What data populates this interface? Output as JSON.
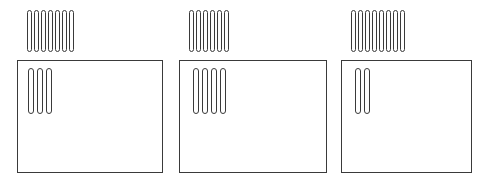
{
  "canvas": {
    "width": 493,
    "height": 180,
    "background": "#ffffff",
    "stroke_color": "#3a3a3a"
  },
  "figure": {
    "type": "tally-mark-diagram",
    "panel_count": 3
  },
  "panels": [
    {
      "id": "panel-1",
      "marks_above_count": 7,
      "marks_inside_count": 3,
      "box": {
        "x": 17,
        "y": 60,
        "width": 146,
        "height": 113
      },
      "marks_above": {
        "x": 27,
        "y": 10
      },
      "marks_inside": {
        "x": 28,
        "y": 68
      }
    },
    {
      "id": "panel-2",
      "marks_above_count": 6,
      "marks_inside_count": 4,
      "box": {
        "x": 179,
        "y": 60,
        "width": 148,
        "height": 113
      },
      "marks_above": {
        "x": 189,
        "y": 10
      },
      "marks_inside": {
        "x": 193,
        "y": 68
      }
    },
    {
      "id": "panel-3",
      "marks_above_count": 8,
      "marks_inside_count": 2,
      "box": {
        "x": 341,
        "y": 60,
        "width": 131,
        "height": 113
      },
      "marks_above": {
        "x": 351,
        "y": 10
      },
      "marks_inside": {
        "x": 355,
        "y": 68
      }
    }
  ]
}
